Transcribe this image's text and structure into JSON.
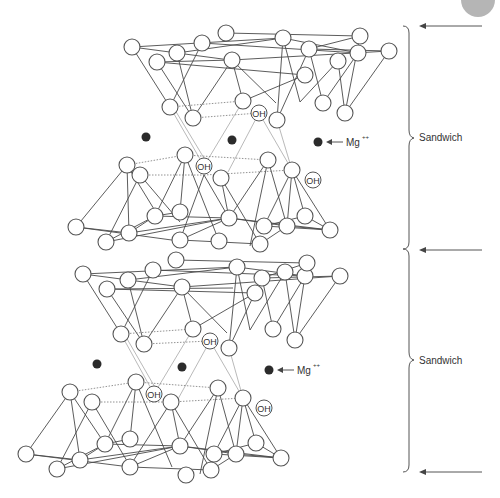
{
  "diagram": {
    "labels": {
      "sandwich_top": "Sandwich",
      "sandwich_bottom": "Sandwich",
      "mg_top": "Mg",
      "mg_top_charge": "++",
      "mg_bottom": "Mg",
      "mg_bottom_charge": "++",
      "oh": "OH"
    },
    "oh_groups": [
      {
        "id": "oh-1",
        "text": "OH",
        "x": 259,
        "y": 113
      },
      {
        "id": "oh-2",
        "text": "OH",
        "x": 204,
        "y": 166
      },
      {
        "id": "oh-3",
        "text": "OH",
        "x": 313,
        "y": 180
      },
      {
        "id": "oh-4",
        "text": "OH",
        "x": 210,
        "y": 341
      },
      {
        "id": "oh-5",
        "text": "OH",
        "x": 154,
        "y": 394
      },
      {
        "id": "oh-6",
        "text": "OH",
        "x": 264,
        "y": 408
      }
    ],
    "interlayer_ions": [
      {
        "id": "ion-1",
        "x": 146,
        "y": 137
      },
      {
        "id": "ion-2",
        "x": 232,
        "y": 140
      },
      {
        "id": "ion-3",
        "x": 318,
        "y": 142,
        "labelled": true
      },
      {
        "id": "ion-4",
        "x": 97,
        "y": 364
      },
      {
        "id": "ion-5",
        "x": 182,
        "y": 367
      },
      {
        "id": "ion-6",
        "x": 269,
        "y": 370,
        "labelled": true
      }
    ],
    "layer_boundaries_y": [
      26,
      249,
      472
    ],
    "colors": {
      "line": "#4a4a4a",
      "ion": "#2b2b2b",
      "background": "#ffffff"
    }
  }
}
